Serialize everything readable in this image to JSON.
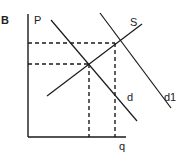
{
  "panel_label": "B",
  "axes": {
    "y_label": "P",
    "x_label": "q"
  },
  "curves": {
    "supply": {
      "label": "S"
    },
    "demand": {
      "label": "d"
    },
    "demand_shifted": {
      "label": "d1"
    }
  },
  "colors": {
    "line": "#1a1a1a",
    "background": "#ffffff"
  }
}
